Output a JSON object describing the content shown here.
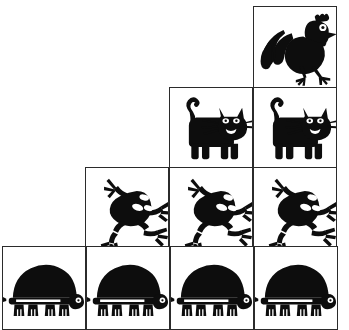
{
  "figure": {
    "background_color": "#ffffff",
    "ink_color": "#0d0d0d",
    "border_color": "#2b2b2b",
    "cell_size_px": 84,
    "columns": 4,
    "rows": 4
  },
  "chart_data": {
    "type": "bar",
    "xlabel": "",
    "ylabel": "Count",
    "categories": [
      "turtle",
      "frog",
      "cat",
      "rooster"
    ],
    "values": [
      4,
      3,
      2,
      1
    ],
    "ylim": [
      0,
      4
    ],
    "grid": true,
    "legend": "none",
    "orientation": "pictogram-staircase"
  },
  "rows": [
    {
      "index": 0,
      "animal": "rooster",
      "label": "rooster",
      "count": 1,
      "top": 6,
      "left": 253,
      "cells": [
        {
          "animal": "rooster",
          "left": 253,
          "top": 6
        }
      ]
    },
    {
      "index": 1,
      "animal": "cat",
      "label": "cat",
      "count": 2,
      "top": 87,
      "left": 169,
      "cells": [
        {
          "animal": "cat",
          "left": 169,
          "top": 87
        },
        {
          "animal": "cat",
          "left": 253,
          "top": 87
        }
      ]
    },
    {
      "index": 2,
      "animal": "frog",
      "label": "frog",
      "count": 3,
      "top": 167,
      "left": 85,
      "cells": [
        {
          "animal": "frog",
          "left": 85,
          "top": 167
        },
        {
          "animal": "frog",
          "left": 169,
          "top": 167
        },
        {
          "animal": "frog",
          "left": 253,
          "top": 167
        }
      ]
    },
    {
      "index": 3,
      "animal": "turtle",
      "label": "turtle",
      "count": 4,
      "top": 246,
      "left": 2,
      "cells": [
        {
          "animal": "turtle",
          "left": 2,
          "top": 246
        },
        {
          "animal": "turtle",
          "left": 86,
          "top": 246
        },
        {
          "animal": "turtle",
          "left": 170,
          "top": 246
        },
        {
          "animal": "turtle",
          "left": 254,
          "top": 246
        }
      ]
    }
  ]
}
